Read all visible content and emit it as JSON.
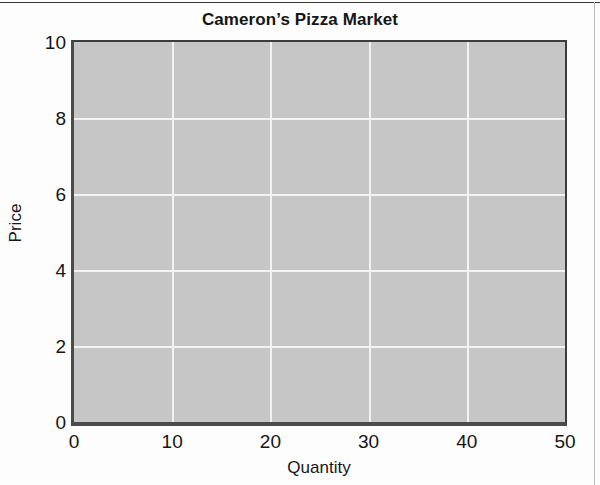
{
  "chart_data": {
    "type": "line",
    "title": "Cameron’s Pizza Market",
    "subtitle": "",
    "xlabel": "Quantity",
    "ylabel": "Price",
    "xlim": [
      0,
      50
    ],
    "ylim": [
      0,
      10
    ],
    "xticks": [
      0,
      10,
      20,
      30,
      40,
      50
    ],
    "yticks": [
      0,
      2,
      4,
      6,
      8,
      10
    ],
    "xtick_labels": [
      "0",
      "10",
      "20",
      "30",
      "40",
      "50"
    ],
    "ytick_labels": [
      "0",
      "2",
      "4",
      "6",
      "8",
      "10"
    ],
    "grid": true,
    "grid_x_values": [
      10,
      20,
      30,
      40
    ],
    "grid_y_values": [
      2,
      4,
      6,
      8
    ],
    "grid_color": "#f2f2f2",
    "plot_background": "#c6c6c6",
    "axis_color": "#4b4b4b",
    "legend": null,
    "legend_position": "none",
    "annotations": [],
    "series": []
  },
  "figure": {
    "title": "Cameron’s Pizza Market",
    "x_axis_title": "Quantity",
    "y_axis_title": "Price"
  }
}
